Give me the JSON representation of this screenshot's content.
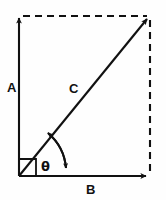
{
  "diagram": {
    "type": "vector-diagram",
    "background_color": "#fefefe",
    "stroke_color": "#111111",
    "labels": {
      "vertical_component": "A",
      "horizontal_component": "B",
      "resultant": "C",
      "angle": "θ"
    },
    "elements": {
      "vertical_axis": {
        "name": "A",
        "style": "solid",
        "arrow": "up",
        "from": [
          19,
          176
        ],
        "to": [
          19,
          14
        ]
      },
      "horizontal_axis": {
        "name": "B",
        "style": "solid",
        "arrow": "right",
        "from": [
          19,
          176
        ],
        "to": [
          150,
          176
        ]
      },
      "resultant": {
        "name": "C",
        "style": "solid",
        "arrow": "up-right",
        "from": [
          19,
          176
        ],
        "to": [
          150,
          16
        ]
      },
      "top_side": {
        "name": "dashed-top",
        "style": "dashed",
        "from": [
          19,
          16
        ],
        "to": [
          150,
          16
        ]
      },
      "right_side": {
        "name": "dashed-right",
        "style": "dashed",
        "from": [
          150,
          16
        ],
        "to": [
          150,
          176
        ]
      },
      "right_angle_marker": {
        "name": "right-angle-square",
        "size_px": 17,
        "corner": [
          19,
          176
        ]
      },
      "angle_arc": {
        "name": "theta-arc",
        "arrows": "both",
        "vertex": [
          19,
          176
        ],
        "radius_px": 52,
        "between": [
          "C",
          "B"
        ]
      }
    }
  }
}
